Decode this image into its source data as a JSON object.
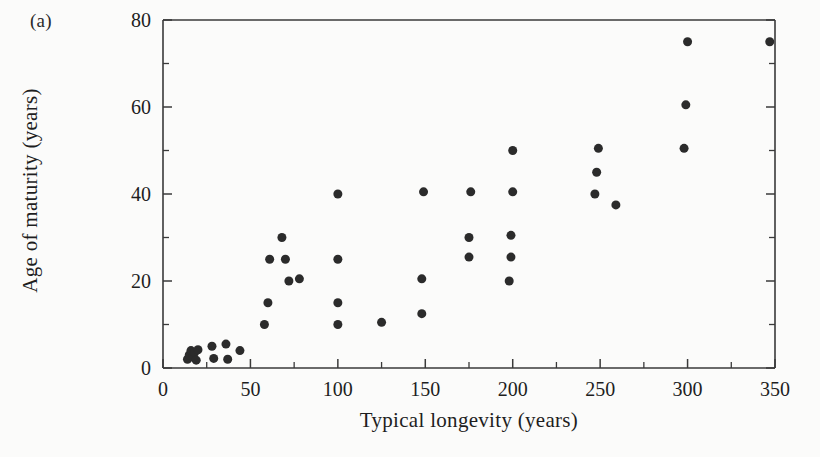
{
  "figure": {
    "panel_label": "(a)",
    "background_color": "#fbfbfa",
    "marker_color": "#2b2b2b",
    "axis_color": "#3a3a3a"
  },
  "chart_data": {
    "type": "scatter",
    "title": "",
    "panel": "(a)",
    "xlabel": "Typical longevity (years)",
    "ylabel": "Age of maturity (years)",
    "xlim": [
      0,
      350
    ],
    "ylim": [
      0,
      80
    ],
    "grid": false,
    "legend": null,
    "x_major_ticks": [
      0,
      50,
      100,
      150,
      200,
      250,
      300,
      350
    ],
    "x_major_tick_labels": [
      "0",
      "50",
      "100",
      "150",
      "200",
      "250",
      "300",
      "350"
    ],
    "x_minor_ticks": [
      25,
      75,
      125,
      175,
      225,
      275,
      325
    ],
    "y_major_ticks": [
      0,
      20,
      40,
      60,
      80
    ],
    "y_major_tick_labels": [
      "0",
      "20",
      "40",
      "60",
      "80"
    ],
    "y_minor_ticks": [
      10,
      30,
      50,
      70
    ],
    "marker": "filled-circle",
    "marker_size_px": 9,
    "points": [
      {
        "x": 14,
        "y": 2.0
      },
      {
        "x": 15,
        "y": 3.0
      },
      {
        "x": 16,
        "y": 4.0
      },
      {
        "x": 17,
        "y": 2.5
      },
      {
        "x": 18,
        "y": 3.5
      },
      {
        "x": 19,
        "y": 1.8
      },
      {
        "x": 20,
        "y": 4.2
      },
      {
        "x": 28,
        "y": 5.0
      },
      {
        "x": 29,
        "y": 2.2
      },
      {
        "x": 36,
        "y": 5.5
      },
      {
        "x": 37,
        "y": 2.0
      },
      {
        "x": 44,
        "y": 4.0
      },
      {
        "x": 58,
        "y": 10.0
      },
      {
        "x": 60,
        "y": 15.0
      },
      {
        "x": 61,
        "y": 25.0
      },
      {
        "x": 68,
        "y": 30.0
      },
      {
        "x": 70,
        "y": 25.0
      },
      {
        "x": 72,
        "y": 20.0
      },
      {
        "x": 78,
        "y": 20.5
      },
      {
        "x": 100,
        "y": 10.0
      },
      {
        "x": 100,
        "y": 15.0
      },
      {
        "x": 100,
        "y": 25.0
      },
      {
        "x": 100,
        "y": 40.0
      },
      {
        "x": 125,
        "y": 10.5
      },
      {
        "x": 148,
        "y": 12.5
      },
      {
        "x": 148,
        "y": 20.5
      },
      {
        "x": 149,
        "y": 40.5
      },
      {
        "x": 175,
        "y": 25.5
      },
      {
        "x": 175,
        "y": 30.0
      },
      {
        "x": 176,
        "y": 40.5
      },
      {
        "x": 198,
        "y": 20.0
      },
      {
        "x": 199,
        "y": 25.5
      },
      {
        "x": 199,
        "y": 30.5
      },
      {
        "x": 200,
        "y": 40.5
      },
      {
        "x": 200,
        "y": 50.0
      },
      {
        "x": 247,
        "y": 40.0
      },
      {
        "x": 248,
        "y": 45.0
      },
      {
        "x": 249,
        "y": 50.5
      },
      {
        "x": 259,
        "y": 37.5
      },
      {
        "x": 298,
        "y": 50.5
      },
      {
        "x": 299,
        "y": 60.5
      },
      {
        "x": 300,
        "y": 75.0
      },
      {
        "x": 347,
        "y": 75.0
      }
    ]
  }
}
